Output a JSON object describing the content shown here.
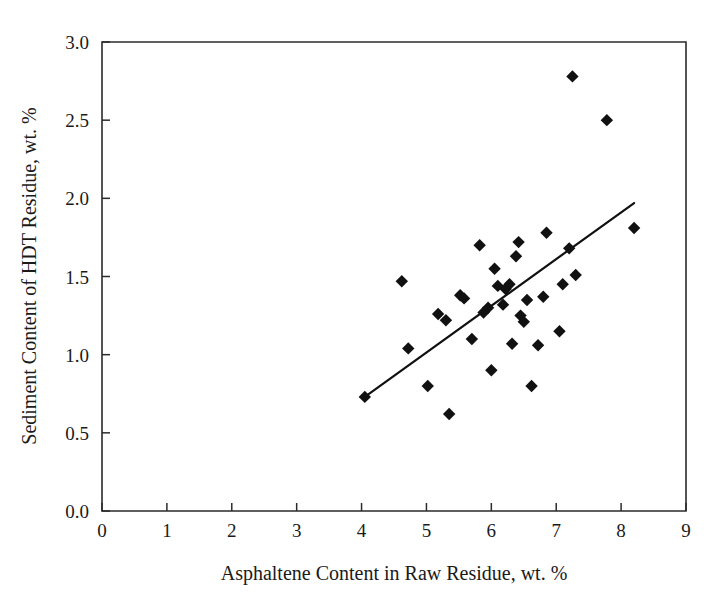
{
  "chart_data": {
    "type": "scatter",
    "title": "",
    "xlabel": "Asphaltene Content in Raw Residue, wt. %",
    "ylabel": "Sediment Content of HDT Residue, wt. %",
    "xlim": [
      0,
      9
    ],
    "ylim": [
      0,
      3.0
    ],
    "xticks": [
      0,
      1,
      2,
      3,
      4,
      5,
      6,
      7,
      8,
      9
    ],
    "xtick_labels": [
      "0",
      "1",
      "2",
      "3",
      "4",
      "5",
      "6",
      "7",
      "8",
      "9"
    ],
    "yticks": [
      0.0,
      0.5,
      1.0,
      1.5,
      2.0,
      2.5,
      3.0
    ],
    "ytick_labels": [
      "0.0",
      "0.5",
      "1.0",
      "1.5",
      "2.0",
      "2.5",
      "3.0"
    ],
    "grid": false,
    "legend": false,
    "marker_shape": "diamond",
    "marker_color": "#111111",
    "series": [
      {
        "name": "Sediment vs Asphaltene",
        "points": [
          [
            4.05,
            0.73
          ],
          [
            4.62,
            1.47
          ],
          [
            4.72,
            1.04
          ],
          [
            5.02,
            0.8
          ],
          [
            5.18,
            1.26
          ],
          [
            5.3,
            1.22
          ],
          [
            5.35,
            0.62
          ],
          [
            5.52,
            1.38
          ],
          [
            5.58,
            1.36
          ],
          [
            5.7,
            1.1
          ],
          [
            5.82,
            1.7
          ],
          [
            5.88,
            1.27
          ],
          [
            5.95,
            1.3
          ],
          [
            6.0,
            0.9
          ],
          [
            6.05,
            1.55
          ],
          [
            6.1,
            1.44
          ],
          [
            6.18,
            1.32
          ],
          [
            6.22,
            1.42
          ],
          [
            6.28,
            1.45
          ],
          [
            6.32,
            1.07
          ],
          [
            6.38,
            1.63
          ],
          [
            6.42,
            1.72
          ],
          [
            6.45,
            1.25
          ],
          [
            6.5,
            1.21
          ],
          [
            6.55,
            1.35
          ],
          [
            6.62,
            0.8
          ],
          [
            6.72,
            1.06
          ],
          [
            6.8,
            1.37
          ],
          [
            6.85,
            1.78
          ],
          [
            7.05,
            1.15
          ],
          [
            7.1,
            1.45
          ],
          [
            7.2,
            1.68
          ],
          [
            7.25,
            2.78
          ],
          [
            7.3,
            1.51
          ],
          [
            7.78,
            2.5
          ],
          [
            8.2,
            1.81
          ]
        ]
      }
    ],
    "trend_line": {
      "type": "linear-fit",
      "x_start": 4.05,
      "y_start": 0.73,
      "x_end": 8.2,
      "y_end": 1.97
    }
  }
}
